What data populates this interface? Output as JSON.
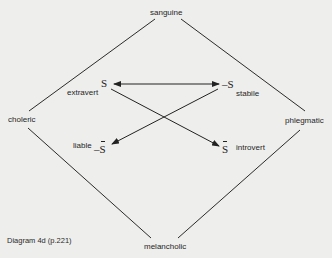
{
  "diagram": {
    "caption": "Diagram 4d (p.221)",
    "temperaments": {
      "top": "sanguine",
      "left": "choleric",
      "right": "phlegmatic",
      "bottom": "melancholic"
    },
    "inner": {
      "s": {
        "symbol": "S",
        "label": "extravert"
      },
      "neg_s": {
        "prefix": "–",
        "symbol": "S",
        "label": "stabile"
      },
      "neg_s_bar": {
        "prefix": "–",
        "symbol": "S",
        "label": "liable"
      },
      "s_bar": {
        "symbol": "S",
        "label": "introvert"
      }
    },
    "edges": [
      {
        "from": "sanguine",
        "to": "choleric",
        "type": "line"
      },
      {
        "from": "sanguine",
        "to": "phlegmatic",
        "type": "line"
      },
      {
        "from": "choleric",
        "to": "melancholic",
        "type": "line"
      },
      {
        "from": "phlegmatic",
        "to": "melancholic",
        "type": "line"
      },
      {
        "from": "S",
        "to": "-S",
        "type": "double-arrow"
      },
      {
        "from": "S",
        "to": "S̄",
        "type": "arrow"
      },
      {
        "from": "-S",
        "to": "-S̄",
        "type": "arrow"
      }
    ],
    "colors": {
      "background": "#eeeeec",
      "ink": "#2b2b2b"
    }
  }
}
